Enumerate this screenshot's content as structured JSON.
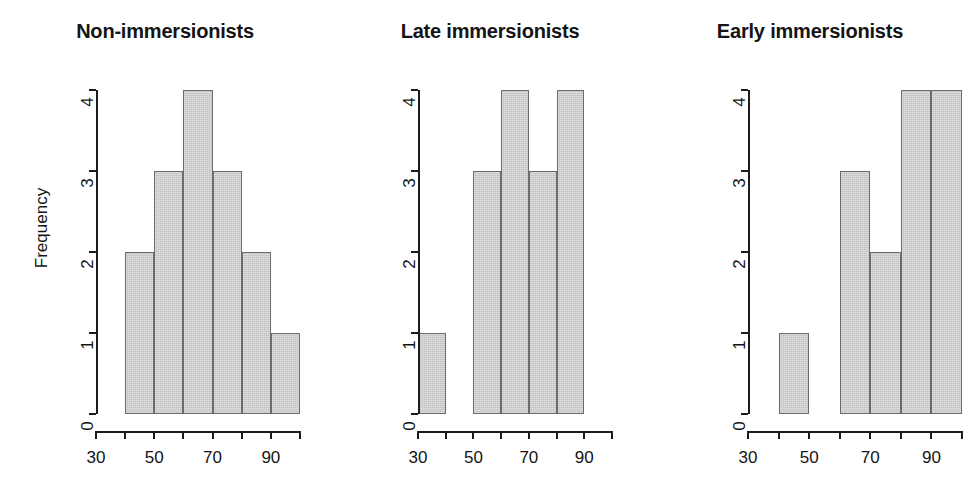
{
  "figure": {
    "background": "#ffffff",
    "bar_fill": "#c2c2c2",
    "bar_border": "#6b6b6b",
    "axis_color": "#1c1c1c",
    "y_axis_label": "Frequency"
  },
  "chart_data": [
    {
      "type": "bar",
      "title": "Non-immersionists",
      "xlabel": "",
      "ylabel": "Frequency",
      "xlim": [
        30,
        100
      ],
      "ylim": [
        0,
        4
      ],
      "grid": false,
      "legend": "none",
      "bin_edges": [
        30,
        40,
        50,
        60,
        70,
        80,
        90,
        100
      ],
      "categories": [
        "30-40",
        "40-50",
        "50-60",
        "60-70",
        "70-80",
        "80-90",
        "90-100"
      ],
      "values": [
        0,
        2,
        3,
        4,
        3,
        2,
        1
      ],
      "xticks": [
        30,
        40,
        50,
        60,
        70,
        80,
        90,
        100
      ],
      "xticklabels": [
        "30",
        "",
        "50",
        "",
        "70",
        "",
        "90",
        ""
      ],
      "yticks": [
        0,
        1,
        2,
        3,
        4
      ],
      "yticklabels": [
        "0",
        "1",
        "2",
        "3",
        "4"
      ]
    },
    {
      "type": "bar",
      "title": "Late immersionists",
      "xlabel": "",
      "ylabel": "",
      "xlim": [
        30,
        100
      ],
      "ylim": [
        0,
        4
      ],
      "grid": false,
      "legend": "none",
      "bin_edges": [
        30,
        40,
        50,
        60,
        70,
        80,
        90,
        100
      ],
      "categories": [
        "30-40",
        "40-50",
        "50-60",
        "60-70",
        "70-80",
        "80-90",
        "90-100"
      ],
      "values": [
        1,
        0,
        3,
        4,
        3,
        4,
        0
      ],
      "xticks": [
        30,
        40,
        50,
        60,
        70,
        80,
        90,
        100
      ],
      "xticklabels": [
        "30",
        "",
        "50",
        "",
        "70",
        "",
        "90",
        ""
      ],
      "yticks": [
        0,
        1,
        2,
        3,
        4
      ],
      "yticklabels": [
        "0",
        "1",
        "2",
        "3",
        "4"
      ]
    },
    {
      "type": "bar",
      "title": "Early immersionists",
      "xlabel": "",
      "ylabel": "",
      "xlim": [
        30,
        100
      ],
      "ylim": [
        0,
        4
      ],
      "grid": false,
      "legend": "none",
      "bin_edges": [
        30,
        40,
        50,
        60,
        70,
        80,
        90,
        100
      ],
      "categories": [
        "30-40",
        "40-50",
        "50-60",
        "60-70",
        "70-80",
        "80-90",
        "90-100"
      ],
      "values": [
        0,
        1,
        0,
        3,
        2,
        4,
        4
      ],
      "xticks": [
        30,
        40,
        50,
        60,
        70,
        80,
        90,
        100
      ],
      "xticklabels": [
        "30",
        "",
        "50",
        "",
        "70",
        "",
        "90",
        ""
      ],
      "yticks": [
        0,
        1,
        2,
        3,
        4
      ],
      "yticklabels": [
        "0",
        "1",
        "2",
        "3",
        "4"
      ]
    }
  ]
}
